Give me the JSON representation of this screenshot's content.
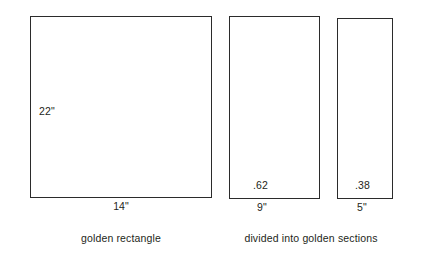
{
  "diagram": {
    "background_color": "#ffffff",
    "line_color": "#2b2b2b",
    "text_color": "#231f20",
    "figures": [
      {
        "id": "golden-rectangle",
        "height_label": "22\"",
        "width_label": "14\"",
        "caption": "golden rectangle"
      },
      {
        "id": "golden-sections",
        "caption": "divided into golden sections",
        "sections": [
          {
            "id": "major",
            "ratio_label": ".62",
            "width_label": "9\""
          },
          {
            "id": "minor",
            "ratio_label": ".38",
            "width_label": "5\""
          }
        ]
      }
    ]
  },
  "chart_data": {
    "type": "diagram",
    "title": "",
    "subtitle": "",
    "shapes": [
      {
        "name": "golden rectangle",
        "kind": "rectangle",
        "width_inches": 14,
        "height_inches": 22,
        "width_label": "14\"",
        "height_label": "22\"",
        "caption": "golden rectangle"
      },
      {
        "name": "golden section major",
        "kind": "rectangle",
        "width_inches": 9,
        "height_inches": 22,
        "width_label": "9\"",
        "ratio": 0.62,
        "ratio_label": ".62",
        "caption": "divided into golden sections"
      },
      {
        "name": "golden section minor",
        "kind": "rectangle",
        "width_inches": 5,
        "height_inches": 22,
        "width_label": "5\"",
        "ratio": 0.38,
        "ratio_label": ".38",
        "caption": "divided into golden sections"
      }
    ],
    "annotations": [
      "22\"",
      "14\"",
      ".62",
      "9\"",
      ".38",
      "5\"",
      "golden rectangle",
      "divided into golden sections"
    ],
    "grid": false,
    "legend": "none"
  }
}
